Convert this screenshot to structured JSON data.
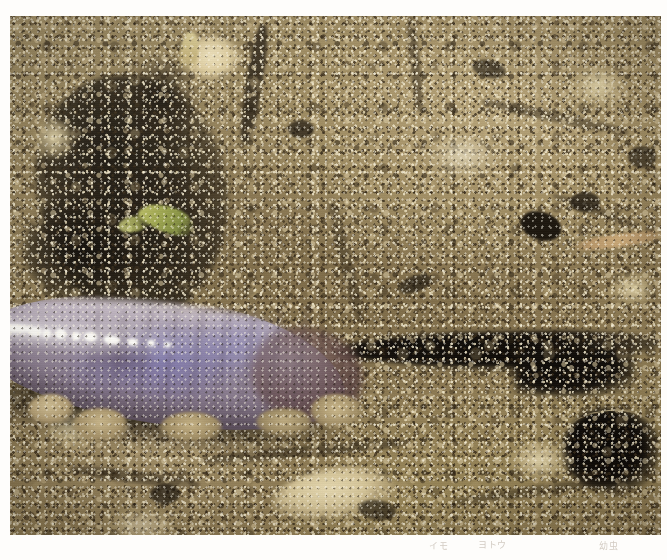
{
  "page": {
    "background_color": "#fefdfb",
    "width": 667,
    "height": 560
  },
  "photo": {
    "name": "soil-larva-macro-photograph",
    "subject": "pale purple-grey larva (leatherjacket / cutworm type) resting in a burrow in granular brown soil",
    "alt_text": "Close-up macro photograph of a smooth grey-violet grub lying on crumbly tan soil beside a dark burrow crevice",
    "frame": {
      "left": 10,
      "top": 16,
      "width": 651,
      "height": 519
    },
    "palette": {
      "soil_light": "#b5a277",
      "soil_mid": "#8d7b55",
      "soil_dark": "#7d6c48",
      "soil_highlight": "#efe4c0",
      "crevice_black": "#0b0805",
      "larva_body": "#94899c",
      "larva_highlight": "#d6ced8",
      "larva_iridescent_blue": "#7674c4",
      "larva_posterior": "#5f4246",
      "plant_green": "#98a24a",
      "root_tan": "#c9a877",
      "specular_white": "#fdfdfb"
    },
    "features": [
      {
        "name": "larva",
        "label": "grub body with segment rings and wet specular highlight"
      },
      {
        "name": "crevice-main",
        "label": "dark horizontal soil tunnel right of the larva"
      },
      {
        "name": "cave-bottom-right",
        "label": "dark burrow opening at lower right"
      },
      {
        "name": "organic-matter-upper-left",
        "label": "black decaying organic mass at upper left"
      },
      {
        "name": "plant-fragment",
        "label": "yellow-green leaf fragment"
      },
      {
        "name": "root-fragment",
        "label": "pale tan rootlet at upper right"
      },
      {
        "name": "pale-stone",
        "label": "bright cream coloured stone at bottom centre"
      },
      {
        "name": "hair-filament",
        "label": "fine light filament across the lower-right burrow"
      }
    ],
    "larva_segments": [
      {
        "x_pct": 30
      },
      {
        "x_pct": 37
      },
      {
        "x_pct": 44
      },
      {
        "x_pct": 51
      },
      {
        "x_pct": 58
      },
      {
        "x_pct": 65
      },
      {
        "x_pct": 72
      },
      {
        "x_pct": 79
      },
      {
        "x_pct": 86
      }
    ],
    "specular_dashes": [
      {
        "left_pct": 0,
        "top_pct": 30,
        "w": 26,
        "h": 7,
        "rot": -3
      },
      {
        "left_pct": 9,
        "top_pct": 22,
        "w": 34,
        "h": 8,
        "rot": -1
      },
      {
        "left_pct": 21,
        "top_pct": 26,
        "w": 14,
        "h": 9,
        "rot": 2
      },
      {
        "left_pct": 27,
        "top_pct": 30,
        "w": 9,
        "h": 9,
        "rot": 0
      },
      {
        "left_pct": 32,
        "top_pct": 28,
        "w": 11,
        "h": 10,
        "rot": 3
      },
      {
        "left_pct": 39,
        "top_pct": 34,
        "w": 8,
        "h": 8,
        "rot": -2
      },
      {
        "left_pct": 44,
        "top_pct": 32,
        "w": 13,
        "h": 9,
        "rot": 1
      },
      {
        "left_pct": 52,
        "top_pct": 38,
        "w": 16,
        "h": 8,
        "rot": 2
      },
      {
        "left_pct": 62,
        "top_pct": 42,
        "w": 10,
        "h": 7,
        "rot": 3
      },
      {
        "left_pct": 70,
        "top_pct": 46,
        "w": 7,
        "h": 6,
        "rot": 0
      },
      {
        "left_pct": 77,
        "top_pct": 50,
        "w": 6,
        "h": 5,
        "rot": 0
      }
    ]
  },
  "caption": {
    "name": "figure-caption",
    "segments": [
      {
        "id": "cap-a",
        "text": "イモ"
      },
      {
        "id": "cap-b",
        "text": "ヨトウ"
      },
      {
        "id": "cap-c",
        "text": "幼虫"
      }
    ]
  }
}
